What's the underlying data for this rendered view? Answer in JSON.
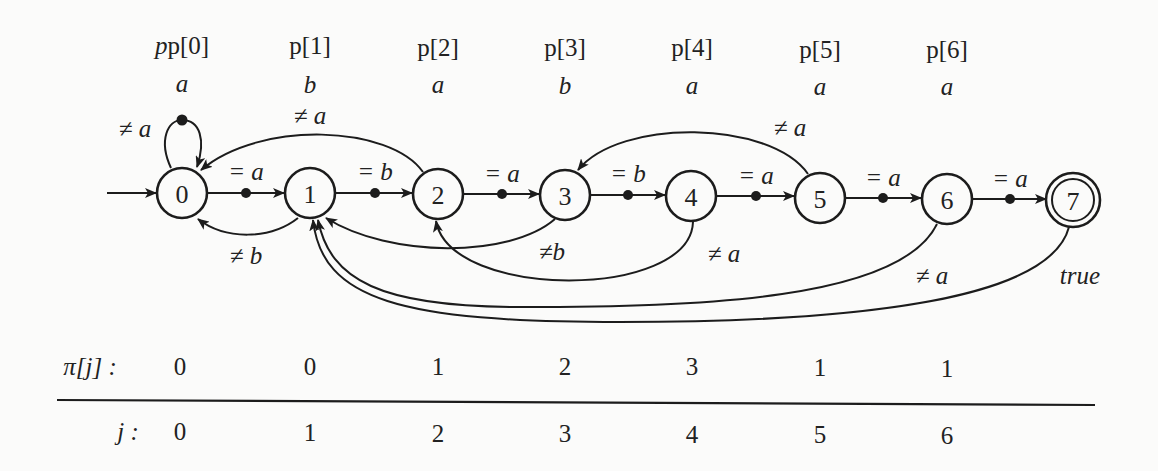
{
  "pattern": {
    "headers": [
      "p[0]",
      "p[1]",
      "p[2]",
      "p[3]",
      "p[4]",
      "p[5]",
      "p[6]"
    ],
    "chars": [
      "a",
      "b",
      "a",
      "b",
      "a",
      "a",
      "a"
    ]
  },
  "states": [
    {
      "id": "0",
      "accepting": false,
      "initial": true
    },
    {
      "id": "1",
      "accepting": false
    },
    {
      "id": "2",
      "accepting": false
    },
    {
      "id": "3",
      "accepting": false
    },
    {
      "id": "4",
      "accepting": false
    },
    {
      "id": "5",
      "accepting": false
    },
    {
      "id": "6",
      "accepting": false
    },
    {
      "id": "7",
      "accepting": true
    }
  ],
  "transitions": {
    "forward": [
      {
        "from": "0",
        "to": "1",
        "label": "= a"
      },
      {
        "from": "1",
        "to": "2",
        "label": "= b"
      },
      {
        "from": "2",
        "to": "3",
        "label": "= a"
      },
      {
        "from": "3",
        "to": "4",
        "label": "= b"
      },
      {
        "from": "4",
        "to": "5",
        "label": "= a"
      },
      {
        "from": "5",
        "to": "6",
        "label": "= a"
      },
      {
        "from": "6",
        "to": "7",
        "label": "= a"
      }
    ],
    "failure": [
      {
        "from": "0",
        "to": "0",
        "label": "≠ a"
      },
      {
        "from": "1",
        "to": "0",
        "label": "≠ b"
      },
      {
        "from": "2",
        "to": "0",
        "label": "≠ a"
      },
      {
        "from": "3",
        "to": "1",
        "label": "≠b"
      },
      {
        "from": "4",
        "to": "2",
        "label": "≠ a"
      },
      {
        "from": "5",
        "to": "3",
        "label": "≠ a"
      },
      {
        "from": "6",
        "to": "1",
        "label": "≠ a"
      },
      {
        "from": "7",
        "to": "1",
        "label": "true"
      }
    ]
  },
  "table": {
    "pi_label": "π[j] :",
    "j_label": "j :",
    "pi_values": [
      "0",
      "0",
      "1",
      "2",
      "3",
      "1",
      "1"
    ],
    "j_values": [
      "0",
      "1",
      "2",
      "3",
      "4",
      "5",
      "6"
    ]
  }
}
